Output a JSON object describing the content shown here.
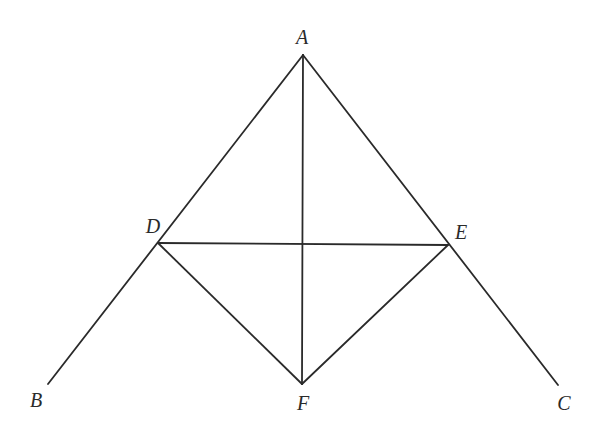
{
  "diagram": {
    "type": "geometry-figure",
    "points": {
      "A": {
        "label": "A",
        "x": 303,
        "y": 55,
        "lx": 302,
        "ly": 44
      },
      "B": {
        "label": "B",
        "x": 48,
        "y": 384,
        "lx": 36,
        "ly": 407
      },
      "C": {
        "label": "C",
        "x": 558,
        "y": 385,
        "lx": 564,
        "ly": 410
      },
      "D": {
        "label": "D",
        "x": 158,
        "y": 243,
        "lx": 153,
        "ly": 233
      },
      "E": {
        "label": "E",
        "x": 448,
        "y": 245,
        "lx": 461,
        "ly": 239
      },
      "F": {
        "label": "F",
        "x": 302,
        "y": 384,
        "lx": 303,
        "ly": 410
      }
    },
    "segments": [
      {
        "name": "AB",
        "from": "A",
        "to": "B"
      },
      {
        "name": "AC",
        "from": "A",
        "to": "C"
      },
      {
        "name": "AF",
        "from": "A",
        "to": "F"
      },
      {
        "name": "DE",
        "from": "D",
        "to": "E"
      },
      {
        "name": "DF",
        "from": "D",
        "to": "F"
      },
      {
        "name": "EF",
        "from": "E",
        "to": "F"
      }
    ],
    "line_color": "#2a2a2a",
    "background": "#ffffff"
  }
}
